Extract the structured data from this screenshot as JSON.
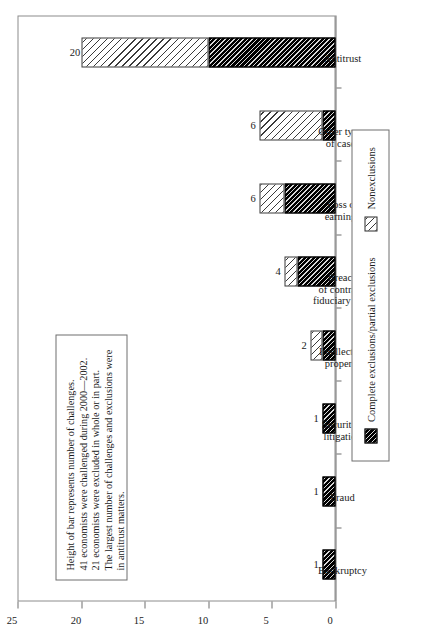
{
  "chart_data": {
    "type": "bar",
    "title": "",
    "subtitle": "",
    "xlabel": "",
    "ylabel": "",
    "ylim": [
      0,
      25
    ],
    "yticks": [
      0,
      5,
      10,
      15,
      20,
      25
    ],
    "ytick_labels": [
      "0",
      "5",
      "10",
      "15",
      "20",
      "25"
    ],
    "grid": false,
    "stacked": true,
    "orientation": "vertical",
    "legend_position": "bottom",
    "categories": [
      "Bankruptcy",
      "Fraud",
      "Securities\nlitigation",
      "Intellectual\nproperty",
      "Breach\nof contract/\nfiduciary duty",
      "Loss of\nearnings",
      "Other types\nof cases",
      "Antitrust"
    ],
    "totals": [
      1,
      1,
      1,
      2,
      4,
      6,
      6,
      20
    ],
    "total_labels": [
      "1",
      "1",
      "1",
      "2",
      "4",
      "6",
      "6",
      "20"
    ],
    "series": [
      {
        "name": "Complete exclusions/partial exclusions",
        "pattern": "dark-hatch",
        "values": [
          1,
          1,
          1,
          1,
          3,
          4,
          1,
          10
        ]
      },
      {
        "name": "Nonexclusions",
        "pattern": "light-hatch",
        "values": [
          0,
          0,
          0,
          1,
          1,
          2,
          5,
          10
        ]
      }
    ]
  },
  "note": {
    "lines": [
      "Height of bar represents number of challenges.",
      "41 economists were challenged during 2000—2002.",
      "21 economists were excluded in whole or in part.",
      "The largest number of challenges and exclusions were",
      "in antitrust matters."
    ]
  },
  "legend": {
    "items": [
      {
        "label": "Complete exclusions/partial exclusions",
        "pattern": "dark-hatch"
      },
      {
        "label": "Nonexclusions",
        "pattern": "light-hatch"
      }
    ]
  }
}
